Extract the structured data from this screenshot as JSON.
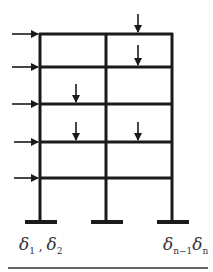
{
  "diagram": {
    "type": "multi-storey frame with lateral and vertical loads",
    "colors": {
      "line": "#1a1a1a",
      "text": "#333333"
    },
    "columns_x": [
      40,
      106,
      172
    ],
    "floors_y": [
      34,
      67,
      104,
      142,
      178
    ],
    "base_y": 222,
    "lateral_loads": [
      {
        "y": 34
      },
      {
        "y": 67
      },
      {
        "y": 104
      },
      {
        "y": 142
      },
      {
        "y": 178
      }
    ],
    "vertical_loads": [
      {
        "x": 138,
        "y": 34
      },
      {
        "x": 138,
        "y": 67
      },
      {
        "x": 76,
        "y": 104
      },
      {
        "x": 76,
        "y": 142
      },
      {
        "x": 138,
        "y": 142
      }
    ],
    "labels": {
      "left": {
        "d1": "δ",
        "s1": "1",
        "sep": " , ",
        "d2": "δ",
        "s2": "2"
      },
      "right": {
        "d1": "δ",
        "s1": "n−1",
        "d2": "δ",
        "s2": "n"
      }
    }
  }
}
